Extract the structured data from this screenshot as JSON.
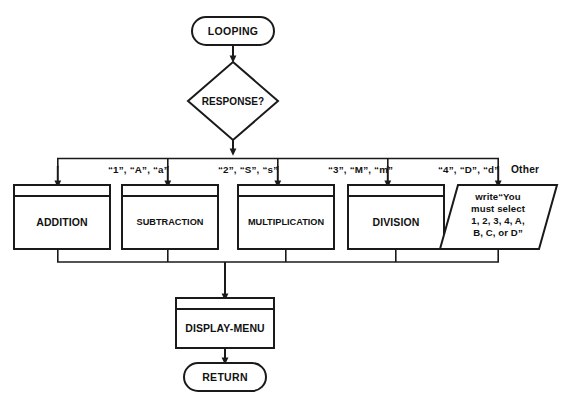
{
  "diagram": {
    "type": "flowchart",
    "colors": {
      "stroke": "#1a1a1a",
      "fill": "#ffffff",
      "text": "#111111",
      "background": "#ffffff"
    },
    "start_terminator": {
      "label": "LOOPING",
      "shape": "terminator"
    },
    "decision": {
      "label": "RESPONSE?",
      "shape": "diamond"
    },
    "branches": [
      {
        "label": "“1”, “A”, “a”",
        "target": "ADDITION"
      },
      {
        "label": "“2”, “S”, “s”",
        "target": "SUBTRACTION"
      },
      {
        "label": "“3”, “M”, “m”",
        "target": "MULTIPLICATION"
      },
      {
        "label": "“4”, “D”, “d”",
        "target": "DIVISION"
      },
      {
        "label": "Other",
        "target": "write-message"
      }
    ],
    "processes": [
      {
        "label": "ADDITION",
        "shape": "predefined-process"
      },
      {
        "label": "SUBTRACTION",
        "shape": "predefined-process"
      },
      {
        "label": "MULTIPLICATION",
        "shape": "predefined-process"
      },
      {
        "label": "DIVISION",
        "shape": "predefined-process"
      }
    ],
    "io_node": {
      "shape": "parallelogram",
      "lines": [
        "write“You",
        "must select",
        "1, 2, 3, 4, A,",
        "B, C, or D”"
      ]
    },
    "merge_process": {
      "label": "DISPLAY-MENU",
      "shape": "predefined-process"
    },
    "end_terminator": {
      "label": "RETURN",
      "shape": "terminator"
    }
  }
}
